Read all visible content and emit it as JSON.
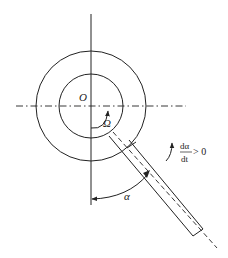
{
  "caption_fragment": "",
  "diagram": {
    "center_label": "O",
    "angular_velocity_label": "Ω",
    "angle_label": "α",
    "derivative": {
      "numerator": "dα",
      "denominator": "dt",
      "relation": "> 0"
    }
  },
  "colors": {
    "stroke": "#222222",
    "background": "#ffffff"
  }
}
